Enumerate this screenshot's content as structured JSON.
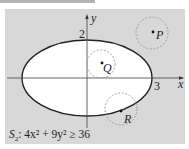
{
  "figure": {
    "axis_labels": {
      "x": "x",
      "y": "y"
    },
    "tick_labels": {
      "y_top": "2",
      "x_right": "3"
    },
    "points": [
      {
        "label": "P",
        "location": "outside ellipse"
      },
      {
        "label": "Q",
        "location": "inside ellipse"
      },
      {
        "label": "R",
        "location": "on ellipse"
      }
    ],
    "formula": {
      "set_name": "S",
      "set_index": "2",
      "expression": ": 4x² + 9y² ≥ 36"
    },
    "colors": {
      "panel_background": "#d8d8d8",
      "ellipse_fill": "#ffffff",
      "stroke": "#222222",
      "dashed_circle": "#999999"
    }
  }
}
